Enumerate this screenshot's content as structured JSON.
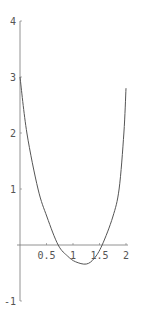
{
  "chart_data": {
    "type": "line",
    "title": "",
    "xlabel": "",
    "ylabel": "",
    "xlim": [
      0,
      2
    ],
    "ylim": [
      -1,
      4
    ],
    "grid": false,
    "legend": null,
    "x_ticks": [
      0.5,
      1,
      1.5,
      2
    ],
    "x_tick_labels": [
      "0.5",
      "1",
      "1.5",
      "2"
    ],
    "y_ticks": [
      -1,
      1,
      2,
      3,
      4
    ],
    "y_tick_labels": [
      "-1",
      "1",
      "2",
      "3",
      "4"
    ],
    "series": [
      {
        "name": "f(x)",
        "color": "#555555",
        "x": [
          0,
          0.13,
          0.34,
          0.51,
          0.72,
          0.9,
          1.05,
          1.25,
          1.4,
          1.55,
          1.75,
          1.87,
          1.96,
          2.0
        ],
        "y": [
          3.0,
          2.0,
          1.0,
          0.5,
          0.0,
          -0.2,
          -0.3,
          -0.34,
          -0.24,
          0.0,
          0.5,
          1.0,
          2.0,
          2.8
        ]
      }
    ]
  },
  "layout": {
    "origin_px": [
      20,
      245
    ],
    "x_px_per_unit": 53,
    "y_px_per_unit": 56,
    "axis_color": "#777777"
  }
}
